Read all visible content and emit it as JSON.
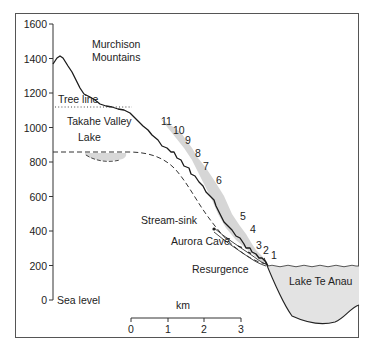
{
  "figure": {
    "colors": {
      "ink": "#222222",
      "border": "#555555",
      "lake_fill": "#e3e3e3",
      "scree_fill": "#c8c8c8",
      "background": "#ffffff"
    },
    "y_axis": {
      "ticks": [
        {
          "value": 1600,
          "label": "1600"
        },
        {
          "value": 1400,
          "label": "1400"
        },
        {
          "value": 1200,
          "label": "1200"
        },
        {
          "value": 1000,
          "label": "1000"
        },
        {
          "value": 800,
          "label": "800"
        },
        {
          "value": 600,
          "label": "600"
        },
        {
          "value": 400,
          "label": "400"
        },
        {
          "value": 200,
          "label": "200"
        },
        {
          "value": 0,
          "label": "0"
        }
      ],
      "zero_label": "Sea level"
    },
    "scale_bar": {
      "unit": "km",
      "ticks": [
        "0",
        "1",
        "2",
        "3"
      ]
    },
    "labels": {
      "mountains_line1": "Murchison",
      "mountains_line2": "Mountains",
      "tree_line": "Tree line",
      "valley": "Takahe Valley",
      "lake": "Lake",
      "stream_sink": "Stream-sink",
      "cave": "Aurora Cave",
      "resurgence": "Resurgence",
      "lake_te_anau": "Lake Te Anau"
    },
    "step_numbers": [
      "11",
      "10",
      "9",
      "8",
      "7",
      "6",
      "5",
      "4",
      "3",
      "2",
      "1"
    ]
  }
}
